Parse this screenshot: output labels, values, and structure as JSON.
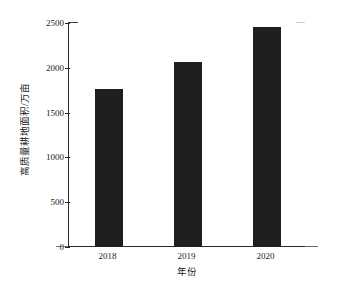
{
  "chart_data": {
    "type": "bar",
    "title": "",
    "subtitle": "",
    "categories": [
      "2018",
      "2019",
      "2020"
    ],
    "values": [
      1765,
      2070,
      2450
    ],
    "series": [
      {
        "name": "高质量耕地面积",
        "values": [
          1765,
          2070,
          2450
        ]
      }
    ],
    "xlabel": "年份",
    "ylabel": "高质量耕地面积/万亩",
    "ylim": [
      0,
      2500
    ],
    "yticks": [
      0,
      500,
      1000,
      1500,
      2000,
      2500
    ],
    "ytick_labels": [
      "0",
      "500",
      "1000",
      "1500",
      "2000",
      "2500"
    ],
    "xtick_labels": [
      "2018",
      "2019",
      "2020"
    ],
    "grid": false,
    "legend": false,
    "legend_position": "none",
    "bar_color": "#1f1f1f",
    "axis_color": "#2b2b2b",
    "background_color": "#ffffff",
    "annotations": []
  }
}
